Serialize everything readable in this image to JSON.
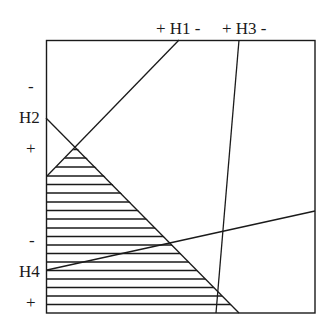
{
  "diagram": {
    "type": "hyperplane-arrangement",
    "box": {
      "x1": 46,
      "y1": 40,
      "x2": 315,
      "y2": 313
    },
    "stroke_color": "#1a1a1a",
    "labels": {
      "h1": "+ H1 -",
      "h3": "+ H3 -",
      "h2_minus": "-",
      "h2": "H2",
      "h2_plus": "+",
      "h4_minus": "-",
      "h4": "H4",
      "h4_plus": "+"
    },
    "lines": [
      {
        "name": "H1",
        "from": [
          47,
          176
        ],
        "to": [
          179,
          40
        ]
      },
      {
        "name": "H2",
        "from": [
          46,
          118
        ],
        "to": [
          239,
          313
        ]
      },
      {
        "name": "H3",
        "from": [
          239,
          40
        ],
        "to": [
          216,
          313
        ]
      },
      {
        "name": "H4",
        "from": [
          47,
          270
        ],
        "to": [
          315,
          211
        ]
      }
    ],
    "shaded_region": {
      "description": "Region on + side of H1 and + side of H2 (lower-left triangle), horizontal hatching",
      "polygon": [
        [
          47,
          176
        ],
        [
          76,
          147
        ],
        [
          239,
          313
        ],
        [
          47,
          313
        ]
      ],
      "hatch_spacing": 8.65
    }
  }
}
